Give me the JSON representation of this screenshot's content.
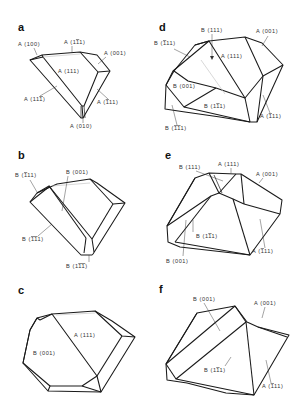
{
  "figure": {
    "background": "#ffffff",
    "line_color": "#1a1a1a",
    "panels": [
      {
        "id": "a",
        "letter": "a",
        "labels": [
          "A (100)",
          "A (1̅1̅1)",
          "A (001)",
          "A (111)",
          "A (11̅1)",
          "A (̅11 1)",
          "A (010)"
        ]
      },
      {
        "id": "d",
        "letter": "d",
        "labels": [
          "B (111)",
          "A (001)",
          "B (̅111)",
          "A (111)",
          "B (001)",
          "B (1̅1 1)",
          "A (̅111)",
          "B (̅1̅1 1)"
        ]
      },
      {
        "id": "b",
        "letter": "b",
        "labels": [
          "B (̅111)",
          "B (001)",
          "B (̅1̅1 1)",
          "B (1̅1̅1)"
        ]
      },
      {
        "id": "e",
        "letter": "e",
        "labels": [
          "B (111)",
          "A (111)",
          "A (001)",
          "B (1̅1 1)",
          "A (̅111)",
          "B (001)"
        ]
      },
      {
        "id": "c",
        "letter": "c",
        "labels": [
          "A (111)",
          "B (001)"
        ]
      },
      {
        "id": "f",
        "letter": "f",
        "labels": [
          "B (001)",
          "A (001)",
          "B (1̅1 1)",
          "A (̅111)"
        ]
      }
    ]
  },
  "text": {
    "a": {
      "letter": "a",
      "l1": "A (100)",
      "l2": "A (1",
      "l2b": "1",
      "l2c": "1)",
      "l3": "A (001)",
      "l4": "A (111)",
      "l5a": "A (11",
      "l5b": "1",
      "l5c": ")",
      "l6a": "A (",
      "l6b": "1",
      "l6c": "11)",
      "l7": "A (010)"
    },
    "d": {
      "letter": "d",
      "l1": "B (111)",
      "l2": "A (001)",
      "l3a": "B (",
      "l3b": "1",
      "l3c": "11)",
      "l4": "A (111)",
      "l5": "B (001)",
      "l6a": "B (1",
      "l6b": "1",
      "l6c": "1)",
      "l7a": "A (",
      "l7b": "1",
      "l7c": "11)",
      "l8a": "B (",
      "l8b": "11",
      "l8c": "1)"
    },
    "b": {
      "letter": "b",
      "l1a": "B (",
      "l1b": "1",
      "l1c": "11)",
      "l2": "B (001)",
      "l3a": "B (",
      "l3b": "11",
      "l3c": "1)",
      "l4a": "B (1",
      "l4b": "11",
      "l4c": ")"
    },
    "e": {
      "letter": "e",
      "l1": "B (111)",
      "l2": "A (111)",
      "l3": "A (001)",
      "l4a": "B (1",
      "l4b": "1",
      "l4c": "1)",
      "l5a": "A (",
      "l5b": "1",
      "l5c": "11)",
      "l6": "B (001)"
    },
    "c": {
      "letter": "c",
      "l1": "A (111)",
      "l2": "B (001)"
    },
    "f": {
      "letter": "f",
      "l1": "B (001)",
      "l2": "A (001)",
      "l3a": "B (1",
      "l3b": "1",
      "l3c": "1)",
      "l4a": "A (",
      "l4b": "1",
      "l4c": "11)"
    }
  }
}
